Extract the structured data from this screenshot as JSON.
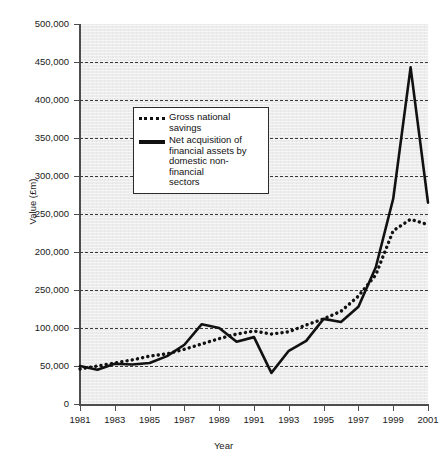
{
  "chart_data": {
    "type": "line",
    "title": "",
    "xlabel": "Year",
    "ylabel": "Value (£m)",
    "xlim": [
      1981,
      2001
    ],
    "ylim": [
      0,
      500000
    ],
    "grid": true,
    "legend_position": "upper-left-inside",
    "x": [
      1981,
      1982,
      1983,
      1984,
      1985,
      1986,
      1987,
      1988,
      1989,
      1990,
      1991,
      1992,
      1993,
      1994,
      1995,
      1996,
      1997,
      1998,
      1999,
      2000,
      2001
    ],
    "y_tick_values": [
      0,
      50000,
      100000,
      150000,
      200000,
      250000,
      300000,
      350000,
      400000,
      450000,
      500000
    ],
    "y_tick_labels": [
      "0",
      "50,000",
      "100,000",
      "250,000",
      "200,000",
      "250,000",
      "300,000",
      "350,000",
      "400,000",
      "450,000",
      "500,000"
    ],
    "x_tick_labels": [
      "1981",
      "1983",
      "1985",
      "1987",
      "1989",
      "1991",
      "1993",
      "1995",
      "1997",
      "1999",
      "2001"
    ],
    "x_tick_values": [
      1981,
      1983,
      1985,
      1987,
      1989,
      1991,
      1993,
      1995,
      1997,
      1999,
      2001
    ],
    "series": [
      {
        "name": "Gross national savings",
        "style": "dotted",
        "color": "#111111",
        "values": [
          46000,
          50000,
          54000,
          58000,
          63000,
          66000,
          72000,
          79000,
          86000,
          92000,
          96000,
          92000,
          95000,
          104000,
          112000,
          122000,
          142000,
          170000,
          228000,
          243000,
          236000
        ]
      },
      {
        "name": "Net acquisition of financial assets by domestic non-financial sectors",
        "style": "solid",
        "color": "#111111",
        "values": [
          50000,
          45000,
          53000,
          52000,
          54000,
          63000,
          78000,
          105000,
          100000,
          82000,
          88000,
          41000,
          70000,
          83000,
          112000,
          108000,
          128000,
          180000,
          270000,
          443000,
          265000
        ]
      }
    ],
    "annotations": [
      "Y-axis tick label at 150,000 position is printed as '250,000' (duplicate of the 250,000 label) in the source figure."
    ]
  },
  "legend": {
    "items": [
      {
        "label": "Gross national savings",
        "style": "dotted"
      },
      {
        "label": "Net acquisition of financial assets by domestic non-financial sectors",
        "style": "solid"
      }
    ],
    "item_0_line_1": "Gross national savings",
    "item_1_line_1": "Net acquisition of",
    "item_1_line_2": "financial assets by",
    "item_1_line_3": "domestic non-financial",
    "item_1_line_4": "sectors"
  },
  "axes": {
    "y_title": "Value (£m)",
    "x_title": "Year"
  },
  "colors": {
    "plot_background": "#ececec",
    "axis": "#4d4d4d",
    "gridline": "#3a3a3a",
    "series": "#111111",
    "page_background": "#ffffff"
  }
}
